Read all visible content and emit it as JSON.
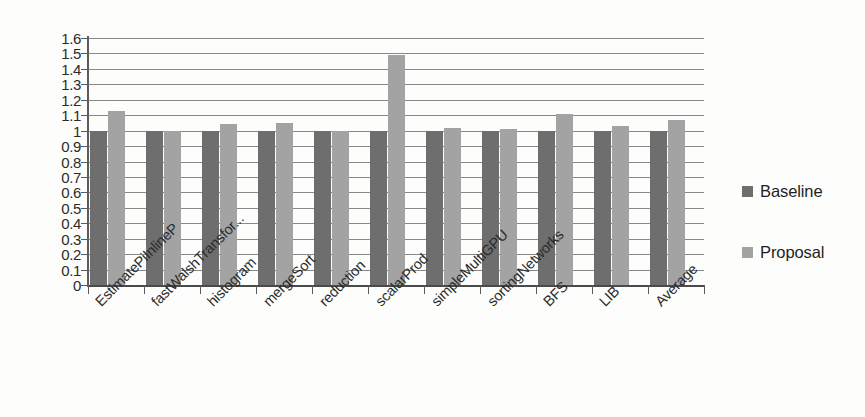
{
  "chart_data": {
    "type": "bar",
    "title": "",
    "xlabel": "",
    "ylabel": "",
    "ylim": [
      0,
      1.6
    ],
    "ytick_step": 0.1,
    "grid": true,
    "legend_position": "right",
    "categories": [
      "EstimatePiInlineP",
      "fastWalshTransfor...",
      "histogram",
      "mergeSort",
      "reduction",
      "scalarProd",
      "simpleMultiGPU",
      "sortingNetworks",
      "BFS",
      "LIB",
      "Average"
    ],
    "ytick_labels": [
      "0",
      "0.1",
      "0.2",
      "0.3",
      "0.4",
      "0.5",
      "0.6",
      "0.7",
      "0.8",
      "0.9",
      "1",
      "1.1",
      "1.2",
      "1.3",
      "1.4",
      "1.5",
      "1.6"
    ],
    "series": [
      {
        "name": "Baseline",
        "color": "#6e6e6e",
        "values": [
          1.0,
          1.0,
          1.0,
          1.0,
          1.0,
          1.0,
          1.0,
          1.0,
          1.0,
          1.0,
          1.0
        ]
      },
      {
        "name": "Proposal",
        "color": "#a3a3a3",
        "values": [
          1.13,
          1.0,
          1.04,
          1.05,
          1.0,
          1.49,
          1.02,
          1.01,
          1.11,
          1.03,
          1.07
        ]
      }
    ]
  },
  "legend": {
    "items": [
      {
        "label": "Baseline",
        "color": "#6e6e6e"
      },
      {
        "label": "Proposal",
        "color": "#a3a3a3"
      }
    ]
  }
}
